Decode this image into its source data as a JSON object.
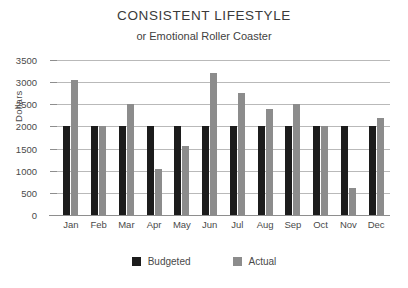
{
  "chart_data": {
    "type": "bar",
    "title": "CONSISTENT LIFESTYLE",
    "subtitle": "or Emotional Roller Coaster",
    "xlabel": "",
    "ylabel": "Dollars",
    "ylim": [
      0,
      3500
    ],
    "ytick_step": 500,
    "ytick_labels": [
      "3500",
      "3000",
      "2500",
      "2000",
      "1500",
      "1000",
      "500",
      "0"
    ],
    "categories": [
      "Jan",
      "Feb",
      "Mar",
      "Apr",
      "May",
      "Jun",
      "Jul",
      "Aug",
      "Sep",
      "Oct",
      "Nov",
      "Dec"
    ],
    "series": [
      {
        "name": "Budgeted",
        "color": "#1c1c1c",
        "values": [
          2000,
          2000,
          2000,
          2000,
          2000,
          2000,
          2000,
          2000,
          2000,
          2000,
          2000,
          2000
        ]
      },
      {
        "name": "Actual",
        "color": "#8c8c8c",
        "values": [
          3050,
          2000,
          2500,
          1050,
          1550,
          3200,
          2750,
          2400,
          2500,
          2000,
          600,
          2200
        ]
      }
    ],
    "grid": true,
    "legend_position": "bottom"
  },
  "legend": {
    "items": [
      {
        "label": "Budgeted",
        "color": "#1c1c1c"
      },
      {
        "label": "Actual",
        "color": "#8c8c8c"
      }
    ]
  }
}
